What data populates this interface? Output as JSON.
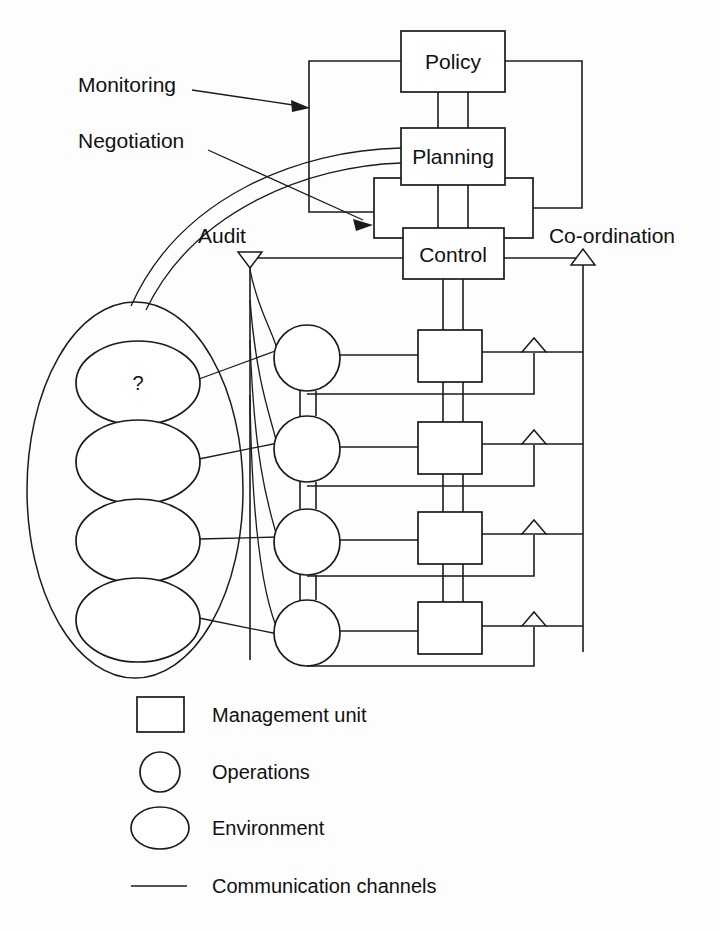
{
  "diagram": {
    "boxes": {
      "policy": "Policy",
      "planning": "Planning",
      "control": "Control"
    },
    "annotations": {
      "monitoring": "Monitoring",
      "negotiation": "Negotiation",
      "audit": "Audit",
      "coordination": "Co-ordination",
      "unknown_environment": "?"
    },
    "legend": {
      "items": [
        {
          "shape": "square",
          "label": "Management unit"
        },
        {
          "shape": "circle",
          "label": "Operations"
        },
        {
          "shape": "ellipse",
          "label": "Environment"
        },
        {
          "shape": "line",
          "label": "Communication channels"
        }
      ]
    },
    "counts": {
      "operations": 4,
      "management_units": 4,
      "environments": 4
    },
    "colors": {
      "stroke": "#1b1b1b",
      "fill": "#ffffff",
      "background": "#fdfdfd"
    }
  }
}
